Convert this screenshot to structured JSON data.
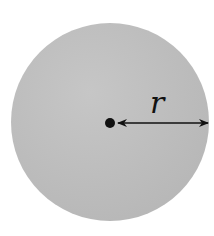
{
  "diagram": {
    "title": "",
    "shape": "circle",
    "fill_color": "#bdbdbd",
    "stroke_color": "#111111",
    "center_point": {
      "label": ""
    },
    "radius_label": "r"
  }
}
